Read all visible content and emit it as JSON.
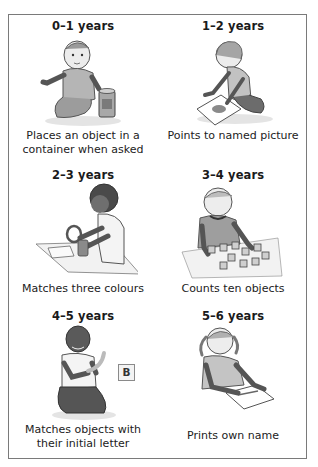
{
  "milestones": [
    {
      "age": "0–1 years",
      "caption_line1": "Places an object in a",
      "caption_line2": "container when asked",
      "illustration": "baby-sitting-with-cup"
    },
    {
      "age": "1–2 years",
      "caption_line1": "Points to  named picture",
      "caption_line2": "",
      "illustration": "toddler-kneeling-pointing-at-picture"
    },
    {
      "age": "2–3 years",
      "caption_line1": "Matches three colours",
      "caption_line2": "",
      "illustration": "child-at-table-with-rings"
    },
    {
      "age": "3–4 years",
      "caption_line1": "Counts ten objects",
      "caption_line2": "",
      "illustration": "child-counting-blocks"
    },
    {
      "age": "4–5 years",
      "caption_line1": "Matches objects with",
      "caption_line2": "their initial letter",
      "illustration": "child-kneeling-holding-banana",
      "letter_card": "B"
    },
    {
      "age": "5–6 years",
      "caption_line1": "Prints own name",
      "caption_line2": "",
      "illustration": "girl-writing-on-paper"
    }
  ],
  "colors": {
    "border": "#7a7a7a",
    "text": "#1a1a1a",
    "sketch": "#555555",
    "shade": "#c8c8c8"
  }
}
